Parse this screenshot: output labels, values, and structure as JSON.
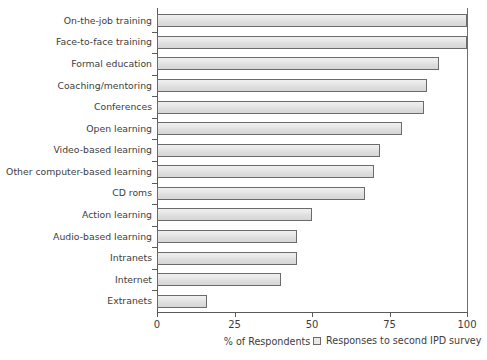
{
  "chart_data": {
    "type": "bar",
    "orientation": "horizontal",
    "title": "",
    "xlabel": "% of Respondents",
    "ylabel": "",
    "xlim": [
      0,
      100
    ],
    "xticks": [
      0,
      25,
      50,
      75,
      100
    ],
    "grid": false,
    "legend_position": "bottom-right",
    "series": [
      {
        "name": "Responses to second IPD survey",
        "color": "#e6e6e6",
        "values": [
          100,
          100,
          91,
          87,
          86,
          79,
          72,
          70,
          67,
          50,
          45,
          45,
          40,
          16
        ]
      }
    ],
    "categories": [
      "On-the-job training",
      "Face-to-face training",
      "Formal education",
      "Coaching/mentoring",
      "Conferences",
      "Open learning",
      "Video-based learning",
      "Other computer-based learning",
      "CD roms",
      "Action learning",
      "Audio-based learning",
      "Intranets",
      "Internet",
      "Extranets"
    ]
  },
  "axis": {
    "x_title": "% of Respondents",
    "tick_labels": [
      "0",
      "25",
      "50",
      "75",
      "100"
    ]
  },
  "legend": {
    "entries": [
      {
        "label": "Responses to second IPD survey",
        "color": "#e6e6e6"
      }
    ]
  }
}
